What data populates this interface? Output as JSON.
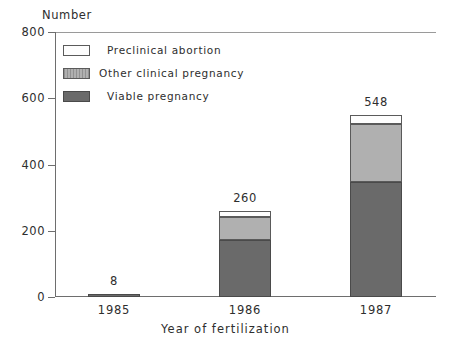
{
  "chart_data": {
    "type": "bar",
    "subtype": "stacked-bar",
    "title": "",
    "ylabel": "Number",
    "xlabel": "Year of fertilization",
    "categories": [
      "1985",
      "1986",
      "1987"
    ],
    "totals": [
      8,
      260,
      548
    ],
    "total_labels": [
      "8",
      "260",
      "548"
    ],
    "ylim": [
      0,
      800
    ],
    "yticks": [
      0,
      200,
      400,
      600,
      800
    ],
    "ytick_labels": [
      "0",
      "200",
      "400",
      "600",
      "800"
    ],
    "grid": false,
    "legend_position": "inside-top-left",
    "series": [
      {
        "name": "Viable pregnancy",
        "color": "#6a6a6a",
        "values": [
          8,
          172,
          347
        ]
      },
      {
        "name": "Other clinical pregnancy",
        "color": "#b0b0b0",
        "values": [
          0,
          70,
          176
        ]
      },
      {
        "name": "Preclinical abortion",
        "color": "#ffffff",
        "values": [
          0,
          18,
          25
        ]
      }
    ]
  },
  "axes": {
    "y_title": "Number",
    "x_title": "Year of fertilization",
    "y_ticks": [
      {
        "label": "800",
        "value": 800
      },
      {
        "label": "600",
        "value": 600
      },
      {
        "label": "400",
        "value": 400
      },
      {
        "label": "200",
        "value": 200
      },
      {
        "label": "0",
        "value": 0
      }
    ],
    "x_ticks": [
      {
        "label": "1985"
      },
      {
        "label": "1986"
      },
      {
        "label": "1987"
      }
    ]
  },
  "legend": {
    "items": [
      {
        "label": "Preclinical abortion",
        "swatch": "white-swatch"
      },
      {
        "label": "Other clinical pregnancy",
        "swatch": "gray-hatched-swatch"
      },
      {
        "label": "Viable pregnancy",
        "swatch": "dark-gray-swatch"
      }
    ]
  },
  "bars": [
    {
      "category": "1985",
      "total_label": "8"
    },
    {
      "category": "1986",
      "total_label": "260"
    },
    {
      "category": "1987",
      "total_label": "548"
    }
  ],
  "colors": {
    "viable": "#6a6a6a",
    "other_clinical": "#b0b0b0",
    "preclinical": "#ffffff",
    "axis": "#6e6e6e",
    "text": "#2e2e2e"
  }
}
